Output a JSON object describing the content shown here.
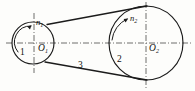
{
  "figure": {
    "kind": "belt-drive-mechanism-diagram",
    "background_color": "#fdfdfb",
    "line_color": "#1b1b1b",
    "centerline_color": "#4a4a4a"
  },
  "labels": {
    "driver_pulley": "1",
    "driven_pulley": "2",
    "belt": "3",
    "driver_center": "O",
    "driver_center_sub": "1",
    "driven_center": "O",
    "driven_center_sub": "2",
    "driver_speed": "n",
    "driver_speed_sub": "1",
    "driven_speed": "n",
    "driven_speed_sub": "2"
  },
  "geometry": {
    "driver_pulley": {
      "cx": 33,
      "cy": 43,
      "r": 21
    },
    "driven_pulley": {
      "cx": 146,
      "cy": 43,
      "r": 37
    },
    "horizontal_centerline": {
      "x1": 6,
      "y1": 43,
      "x2": 191,
      "y2": 43
    },
    "driver_vertical_centerline": {
      "x": 34,
      "y1": 13,
      "y2": 73
    },
    "driven_vertical_centerline": {
      "x": 146,
      "y1": 2,
      "y2": 89
    },
    "belt_upper": {
      "x1": 47,
      "y1": 24,
      "x2": 147,
      "y2": 6
    },
    "belt_lower": {
      "x1": 45,
      "y1": 62,
      "x2": 147,
      "y2": 80
    }
  }
}
